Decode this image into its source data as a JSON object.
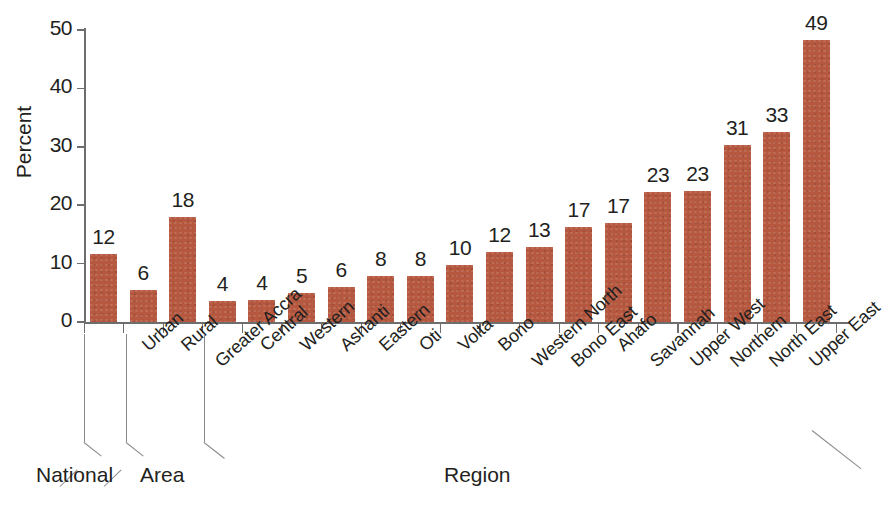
{
  "chart_data": {
    "type": "bar",
    "title": "",
    "xlabel": "Region",
    "ylabel": "Percent",
    "ylim": [
      0,
      50
    ],
    "ytick_labels": [
      "0",
      "10",
      "20",
      "30",
      "40",
      "50"
    ],
    "ytick_values": [
      0,
      10,
      20,
      30,
      40,
      50
    ],
    "grid": false,
    "legend": "none",
    "bar_color": "#b5583f",
    "categories": [
      "Urban",
      "Rural",
      "Greater Accra",
      "Central",
      "Western",
      "Ashanti",
      "Eastern",
      "Oti",
      "Volta",
      "Bono",
      "Western North",
      "Bono East",
      "Ahafo",
      "Savannah",
      "Upper West",
      "Northern",
      "North East",
      "Upper East"
    ],
    "national_label": "",
    "bars": [
      {
        "label": "",
        "value": 12,
        "display": "12",
        "plotted": 11.6,
        "group": "National"
      },
      {
        "label": "Urban",
        "value": 6,
        "display": "6",
        "plotted": 5.5,
        "group": "Area"
      },
      {
        "label": "Rural",
        "value": 18,
        "display": "18",
        "plotted": 18.0,
        "group": "Area"
      },
      {
        "label": "Greater Accra",
        "value": 4,
        "display": "4",
        "plotted": 3.6,
        "group": "Region"
      },
      {
        "label": "Central",
        "value": 4,
        "display": "4",
        "plotted": 3.8,
        "group": "Region"
      },
      {
        "label": "Western",
        "value": 5,
        "display": "5",
        "plotted": 5.0,
        "group": "Region"
      },
      {
        "label": "Ashanti",
        "value": 6,
        "display": "6",
        "plotted": 6.0,
        "group": "Region"
      },
      {
        "label": "Eastern",
        "value": 8,
        "display": "8",
        "plotted": 7.8,
        "group": "Region"
      },
      {
        "label": "Oti",
        "value": 8,
        "display": "8",
        "plotted": 7.8,
        "group": "Region"
      },
      {
        "label": "Volta",
        "value": 10,
        "display": "10",
        "plotted": 9.7,
        "group": "Region"
      },
      {
        "label": "Bono",
        "value": 12,
        "display": "12",
        "plotted": 12.0,
        "group": "Region"
      },
      {
        "label": "Western North",
        "value": 13,
        "display": "13",
        "plotted": 12.9,
        "group": "Region"
      },
      {
        "label": "Bono East",
        "value": 17,
        "display": "17",
        "plotted": 16.3,
        "group": "Region"
      },
      {
        "label": "Ahafo",
        "value": 17,
        "display": "17",
        "plotted": 16.9,
        "group": "Region"
      },
      {
        "label": "Savannah",
        "value": 23,
        "display": "23",
        "plotted": 22.3,
        "group": "Region"
      },
      {
        "label": "Upper West",
        "value": 23,
        "display": "23",
        "plotted": 22.4,
        "group": "Region"
      },
      {
        "label": "Northern",
        "value": 31,
        "display": "31",
        "plotted": 30.3,
        "group": "Region"
      },
      {
        "label": "North East",
        "value": 33,
        "display": "33",
        "plotted": 32.5,
        "group": "Region"
      },
      {
        "label": "Upper East",
        "value": 49,
        "display": "49",
        "plotted": 48.3,
        "group": "Region"
      }
    ],
    "groups": [
      {
        "label": "National"
      },
      {
        "label": "Area"
      },
      {
        "label": "Region"
      }
    ]
  }
}
